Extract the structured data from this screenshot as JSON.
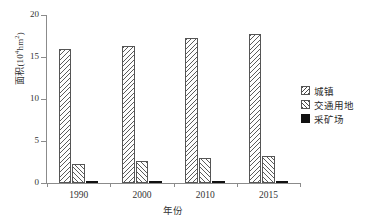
{
  "chart_data": {
    "type": "bar",
    "title": "",
    "subtitle": "",
    "xlabel": "年份",
    "ylabel": "面积(10⁴hm²)",
    "ylabel_base": "面积(10",
    "ylabel_exp1": "4",
    "ylabel_mid": "hm",
    "ylabel_exp2": "2",
    "ylabel_end": ")",
    "categories": [
      "1990",
      "2000",
      "2010",
      "2015"
    ],
    "series": [
      {
        "name": "城镇",
        "values": [
          16.0,
          16.3,
          17.3,
          17.7
        ],
        "pattern": "hatch-back",
        "color": "#5a5a5a"
      },
      {
        "name": "交通用地",
        "values": [
          2.3,
          2.6,
          3.0,
          3.2
        ],
        "pattern": "hatch-fwd",
        "color": "#5a5a5a"
      },
      {
        "name": "采矿场",
        "values": [
          0.12,
          0.15,
          0.22,
          0.25
        ],
        "pattern": "solid",
        "color": "#111111"
      }
    ],
    "ylim": [
      0,
      20
    ],
    "yticks": [
      0,
      5,
      10,
      15,
      20
    ],
    "ytick_labels": [
      "0",
      "5",
      "10",
      "15",
      "20"
    ],
    "grid": false,
    "legend_position": "right"
  },
  "legend": {
    "items": [
      {
        "label": "城镇"
      },
      {
        "label": "交通用地"
      },
      {
        "label": "采矿场"
      }
    ]
  },
  "axes": {
    "y_title": "面积(10⁴hm²)",
    "x_title": "年份"
  }
}
